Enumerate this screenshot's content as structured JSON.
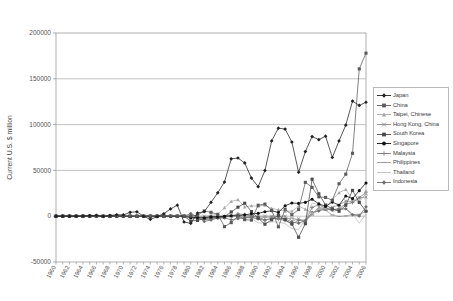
{
  "chart_data": {
    "type": "line",
    "title": "",
    "xlabel": "",
    "ylabel": "Current U.S. $ million",
    "ylim": [
      -50000,
      200000
    ],
    "yticks": [
      -50000,
      0,
      50000,
      100000,
      150000,
      200000
    ],
    "ytick_labels": [
      "-50000",
      "0",
      "50000",
      "100000",
      "150000",
      "200000"
    ],
    "grid": true,
    "legend_position": "right",
    "x": [
      1960,
      1961,
      1962,
      1963,
      1964,
      1965,
      1966,
      1967,
      1968,
      1969,
      1970,
      1971,
      1972,
      1973,
      1974,
      1975,
      1976,
      1977,
      1978,
      1979,
      1980,
      1981,
      1982,
      1983,
      1984,
      1985,
      1986,
      1987,
      1988,
      1989,
      1990,
      1991,
      1992,
      1993,
      1994,
      1995,
      1996,
      1997,
      1998,
      1999,
      2000,
      2001,
      2002,
      2003,
      2004,
      2005,
      2006
    ],
    "xtick_labels": [
      "1960",
      "1962",
      "1964",
      "1966",
      "1968",
      "1970",
      "1972",
      "1974",
      "1976",
      "1978",
      "1980",
      "1982",
      "1984",
      "1986",
      "1988",
      "1990",
      "1992",
      "1994",
      "1996",
      "1998",
      "2000",
      "2002",
      "2004",
      "2006"
    ],
    "series": [
      {
        "name": "Japan",
        "color": "#222222",
        "marker": "diamond",
        "values": [
          100,
          150,
          200,
          250,
          300,
          900,
          1250,
          -200,
          1050,
          2100,
          1970,
          5800,
          6600,
          -130,
          -4700,
          -680,
          3680,
          10900,
          16500,
          -8700,
          -10700,
          4770,
          6850,
          20800,
          35000,
          51100,
          85800,
          87000,
          79600,
          57000,
          44100,
          68200,
          112600,
          131600,
          130300,
          111000,
          65800,
          96600,
          119100,
          114500,
          119700,
          87800,
          112600,
          136200,
          172100,
          165700,
          170400
        ],
        "scale": 0.73
      },
      {
        "name": "China",
        "color": "#5a5a5a",
        "marker": "square",
        "values": [
          0,
          0,
          0,
          0,
          0,
          0,
          0,
          0,
          0,
          0,
          0,
          0,
          0,
          0,
          0,
          0,
          0,
          0,
          0,
          0,
          280,
          1200,
          5670,
          4240,
          2030,
          -11400,
          -7030,
          300,
          -3800,
          -4300,
          11997,
          13272,
          6401,
          -11609,
          7658,
          1618,
          7243,
          36963,
          31472,
          21115,
          20519,
          17405,
          35422,
          45875,
          68659,
          160818,
          178000
        ],
        "scale": 1.0
      },
      {
        "name": "Taipei, Chinese",
        "color": "#a8a8a8",
        "marker": "triangle",
        "values": [
          0,
          0,
          0,
          0,
          0,
          0,
          0,
          0,
          0,
          0,
          0,
          0,
          0,
          0,
          0,
          0,
          0,
          0,
          0,
          0,
          -900,
          -300,
          -600,
          1000,
          1900,
          9200,
          16200,
          18000,
          10200,
          11400,
          10900,
          12000,
          8500,
          7000,
          5400,
          5470,
          10920,
          7680,
          3440,
          8400,
          8910,
          18200,
          25630,
          29300,
          18500,
          16000,
          24700
        ],
        "scale": 1.0
      },
      {
        "name": "Hong Kong, China",
        "color": "#8f8f8f",
        "marker": "x",
        "values": [
          0,
          0,
          0,
          0,
          0,
          0,
          0,
          0,
          0,
          0,
          0,
          0,
          0,
          0,
          0,
          0,
          0,
          0,
          0,
          0,
          0,
          0,
          0,
          0,
          0,
          0,
          0,
          0,
          0,
          0,
          0,
          0,
          0,
          0,
          0,
          -5000,
          -3000,
          -6000,
          2500,
          10000,
          7500,
          9800,
          12400,
          16500,
          15900,
          20200,
          20800
        ],
        "scale": 1.0
      },
      {
        "name": "South Korea",
        "color": "#4a4a4a",
        "marker": "square",
        "values": [
          0,
          0,
          0,
          0,
          0,
          0,
          0,
          0,
          0,
          0,
          0,
          0,
          0,
          0,
          0,
          0,
          0,
          0,
          0,
          0,
          -5300,
          -4600,
          -2600,
          -1600,
          -1370,
          -790,
          4620,
          9850,
          14160,
          5060,
          -2000,
          -8730,
          -3940,
          990,
          -3870,
          -8500,
          -23000,
          -8200,
          40400,
          24500,
          12200,
          8030,
          5390,
          11950,
          28170,
          14980,
          5390
        ],
        "scale": 1.0
      },
      {
        "name": "Singapore",
        "color": "#111111",
        "marker": "circle",
        "values": [
          0,
          0,
          0,
          0,
          0,
          0,
          0,
          0,
          0,
          0,
          0,
          0,
          0,
          0,
          0,
          0,
          0,
          0,
          0,
          0,
          -1560,
          -1480,
          -1700,
          -570,
          -380,
          -30,
          450,
          540,
          1500,
          2700,
          3100,
          4880,
          5900,
          4200,
          11400,
          14400,
          14000,
          15100,
          18500,
          13500,
          10700,
          15400,
          12000,
          22100,
          19200,
          27900,
          36300
        ],
        "scale": 1.0
      },
      {
        "name": "Malaysia",
        "color": "#7a7a7a",
        "marker": "plus",
        "values": [
          0,
          0,
          0,
          0,
          0,
          0,
          0,
          0,
          0,
          0,
          0,
          0,
          0,
          0,
          0,
          0,
          0,
          0,
          0,
          0,
          -260,
          -2490,
          -3590,
          -3500,
          -1660,
          -600,
          -110,
          2570,
          1870,
          60,
          -870,
          -4180,
          -2170,
          -2990,
          -4520,
          -8640,
          -4460,
          -5940,
          9530,
          12600,
          8490,
          7290,
          8030,
          13380,
          14870,
          19980,
          26200
        ],
        "scale": 1.0
      },
      {
        "name": "Philippines",
        "color": "#9a9a9a",
        "marker": "dash",
        "values": [
          0,
          0,
          0,
          0,
          0,
          0,
          0,
          0,
          0,
          0,
          0,
          0,
          0,
          0,
          0,
          0,
          0,
          0,
          0,
          0,
          -1900,
          -2300,
          -3200,
          -2800,
          -1300,
          -30,
          950,
          -440,
          -390,
          -1460,
          -2700,
          -1030,
          -1000,
          -3020,
          -2950,
          -1980,
          -3950,
          -4350,
          1350,
          7900,
          6260,
          1320,
          -280,
          290,
          1630,
          1980,
          5300
        ],
        "scale": 1.0
      },
      {
        "name": "Thailand",
        "color": "#bdbdbd",
        "marker": "line",
        "values": [
          0,
          0,
          0,
          0,
          0,
          0,
          0,
          0,
          0,
          0,
          0,
          0,
          0,
          0,
          0,
          0,
          0,
          0,
          0,
          0,
          -2070,
          -2570,
          -1000,
          -2870,
          -2110,
          -1540,
          250,
          -370,
          -1650,
          -2500,
          -7280,
          -7570,
          -6300,
          -6360,
          -8090,
          -13550,
          -14690,
          -3110,
          14240,
          12470,
          9320,
          5100,
          7000,
          8000,
          2770,
          -7640,
          2300
        ],
        "scale": 1.0
      },
      {
        "name": "Indonesia",
        "color": "#6e6e6e",
        "marker": "diamond",
        "values": [
          0,
          0,
          0,
          0,
          0,
          0,
          0,
          0,
          0,
          0,
          0,
          0,
          0,
          0,
          0,
          0,
          0,
          0,
          0,
          0,
          2900,
          -800,
          -5800,
          -4100,
          -2000,
          -1900,
          -3900,
          -2800,
          -1600,
          -1100,
          -2980,
          -4260,
          -2780,
          -2110,
          -2790,
          -6430,
          -7660,
          -5000,
          4100,
          5780,
          7990,
          6900,
          7820,
          8110,
          1560,
          280,
          10200
        ],
        "scale": 1.0
      }
    ]
  },
  "legend": {
    "entries": [
      {
        "label": "Japan"
      },
      {
        "label": "China"
      },
      {
        "label": "Taipei, Chinese"
      },
      {
        "label": "Hong Kong, China"
      },
      {
        "label": "South Korea"
      },
      {
        "label": "Singapore"
      },
      {
        "label": "Malaysia"
      },
      {
        "label": "Philippines"
      },
      {
        "label": "Thailand"
      },
      {
        "label": "Indonesia"
      }
    ]
  }
}
